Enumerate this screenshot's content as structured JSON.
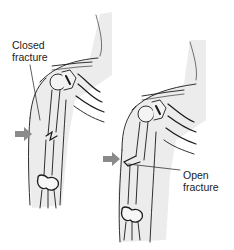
{
  "diagram": {
    "panels": [
      {
        "id": "closed",
        "label_line1": "Closed",
        "label_line2": "fracture",
        "arrow_color": "#8a8a8a"
      },
      {
        "id": "open",
        "label_line1": "Open",
        "label_line2": "fracture",
        "arrow_color": "#8a8a8a"
      }
    ],
    "colors": {
      "line": "#1a1a1a",
      "skin_shade": "#e6e6e6",
      "background": "#ffffff"
    }
  }
}
